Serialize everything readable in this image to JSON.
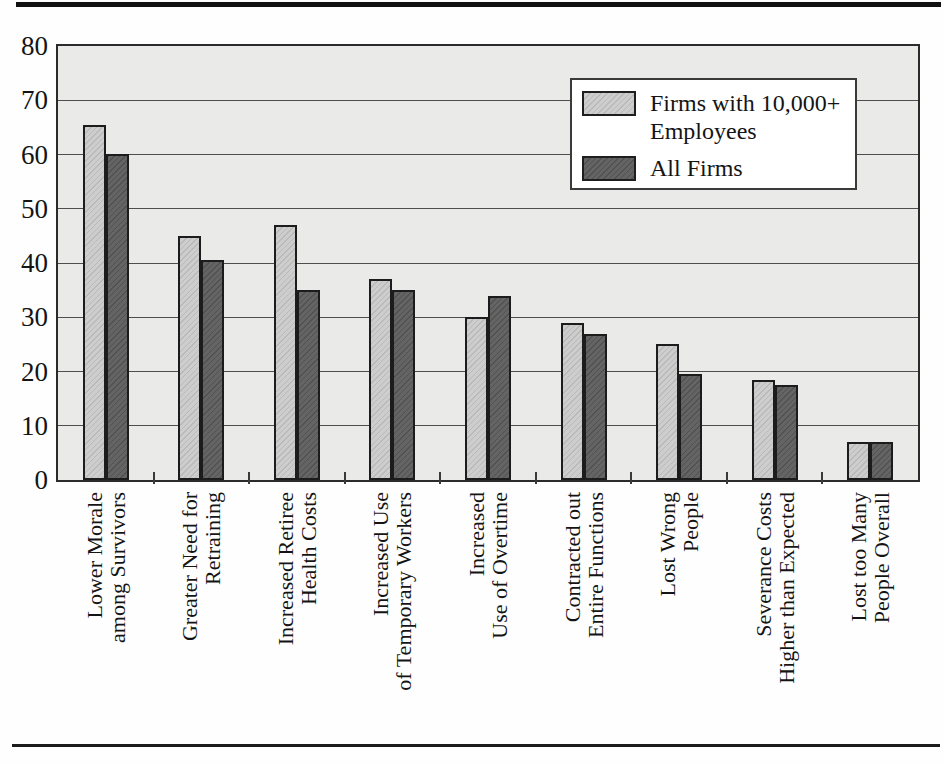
{
  "chart_data": {
    "type": "bar",
    "title": "",
    "xlabel": "",
    "ylabel": "",
    "categories": [
      "Lower Morale among Survivors",
      "Greater Need for Retraining",
      "Increased Retiree Health Costs",
      "Increased Use of Temporary Workers",
      "Increased Use of Overtime",
      "Contracted out Entire Functions",
      "Lost Wrong People",
      "Severance Costs Higher than Expected",
      "Lost too Many People Overall"
    ],
    "category_label_lines": [
      [
        "Lower Morale",
        "among Survivors"
      ],
      [
        "Greater Need for",
        "Retraining"
      ],
      [
        "Increased Retiree",
        "Health Costs"
      ],
      [
        "Increased Use",
        "of Temporary Workers"
      ],
      [
        "Increased",
        "Use of Overtime"
      ],
      [
        "Contracted out",
        "Entire Functions"
      ],
      [
        "Lost Wrong",
        "People"
      ],
      [
        "Severance Costs",
        "Higher than Expected"
      ],
      [
        "Lost too Many",
        "People Overall"
      ]
    ],
    "series": [
      {
        "name": "Firms with 10,000+ Employees",
        "color": "#cdcdcd",
        "values": [
          65.5,
          45,
          47,
          37,
          30,
          29,
          25,
          18.5,
          7
        ]
      },
      {
        "name": "All Firms",
        "color": "#646464",
        "values": [
          60,
          40.5,
          35,
          35,
          34,
          27,
          19.5,
          17.5,
          7
        ]
      }
    ],
    "ylim": [
      0,
      80
    ],
    "yticks": [
      0,
      10,
      20,
      30,
      40,
      50,
      60,
      70,
      80
    ],
    "grid": "horizontal",
    "legend_position": "upper-right",
    "plot_background": "#eaeae8",
    "gridline_color": "#4d4d4d"
  }
}
